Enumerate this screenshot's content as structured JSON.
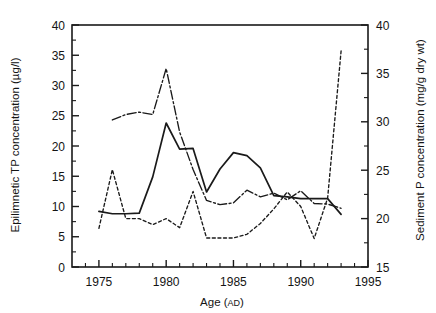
{
  "chart_data": {
    "type": "line",
    "title": "",
    "xlabel": "Age (AD)",
    "xlabel_main": "Age (",
    "xlabel_smallcaps": "AD",
    "xlabel_tail": ")",
    "ylabel": "Epilimnetic TP concentration (µg/l)",
    "ylabel_right": "Sediment P concentration (mg/g dry wt)",
    "xlim": [
      1973,
      1995
    ],
    "xticks_major": [
      1975,
      1980,
      1985,
      1990,
      1995
    ],
    "xticks_minor": [
      1974,
      1976,
      1977,
      1978,
      1979,
      1981,
      1982,
      1983,
      1984,
      1986,
      1987,
      1988,
      1989,
      1991,
      1992,
      1993,
      1994
    ],
    "ylim": [
      0,
      40
    ],
    "yticks_major": [
      0,
      5,
      10,
      15,
      20,
      25,
      30,
      35,
      40
    ],
    "ylim_right": [
      15,
      40
    ],
    "yticks_right_major": [
      15,
      20,
      25,
      30,
      35,
      40
    ],
    "yticks_right_minor": [
      17.5,
      22.5,
      27.5,
      32.5,
      37.5
    ],
    "grid": false,
    "legend": "none",
    "line_color": "#1a1a1a",
    "series": [
      {
        "name": "epilimnetic-tp-solid",
        "style": "solid",
        "axis": "left",
        "x": [
          1975,
          1976,
          1977,
          1978,
          1979,
          1980,
          1981,
          1982,
          1983,
          1984,
          1985,
          1986,
          1987,
          1988,
          1989,
          1990,
          1991,
          1992,
          1993
        ],
        "values": [
          9.2,
          8.8,
          8.8,
          8.9,
          14.9,
          23.8,
          19.5,
          19.6,
          12.4,
          16.2,
          18.9,
          18.4,
          16.4,
          11.8,
          11.6,
          11.3,
          11.3,
          11.3,
          8.7
        ]
      },
      {
        "name": "sediment-p-dashdot",
        "style": "dashdot",
        "axis": "right",
        "x": [
          1976,
          1977,
          1978,
          1979,
          1980,
          1981,
          1982,
          1983,
          1984,
          1985,
          1986,
          1987,
          1988,
          1989,
          1990,
          1991,
          1992,
          1993
        ],
        "values_left_scale": [
          24.3,
          25.2,
          25.6,
          25.2,
          32.8,
          22.3,
          16.1,
          11.0,
          10.3,
          10.6,
          12.7,
          11.6,
          12.2,
          11.1,
          12.6,
          10.5,
          10.4,
          9.7
        ],
        "values": [
          30.2,
          30.8,
          31.0,
          30.8,
          35.5,
          28.9,
          25.1,
          21.9,
          21.4,
          21.6,
          22.9,
          22.3,
          22.6,
          21.9,
          22.9,
          21.6,
          21.5,
          21.1
        ]
      },
      {
        "name": "sediment-p-dotted",
        "style": "dotted",
        "axis": "right",
        "x": [
          1975,
          1976,
          1977,
          1978,
          1979,
          1980,
          1981,
          1982,
          1983,
          1984,
          1985,
          1986,
          1987,
          1988,
          1989,
          1990,
          1991,
          1992,
          1993
        ],
        "values_left_scale": [
          6.4,
          16.1,
          8.0,
          8.0,
          7.0,
          8.0,
          6.5,
          12.5,
          4.8,
          4.8,
          4.8,
          5.4,
          7.2,
          9.6,
          12.4,
          10.0,
          4.7,
          11.4,
          35.7
        ],
        "values": [
          19.0,
          25.1,
          20.0,
          20.0,
          19.4,
          20.0,
          19.1,
          22.8,
          18.0,
          18.0,
          18.0,
          18.4,
          19.5,
          21.0,
          22.8,
          21.3,
          17.9,
          22.1,
          37.3
        ]
      }
    ]
  },
  "ticks": {
    "x": [
      "1975",
      "1980",
      "1985",
      "1990",
      "1995"
    ],
    "y_left": [
      "0",
      "5",
      "10",
      "15",
      "20",
      "25",
      "30",
      "35",
      "40"
    ],
    "y_right": [
      "15",
      "20",
      "25",
      "30",
      "35",
      "40"
    ]
  }
}
